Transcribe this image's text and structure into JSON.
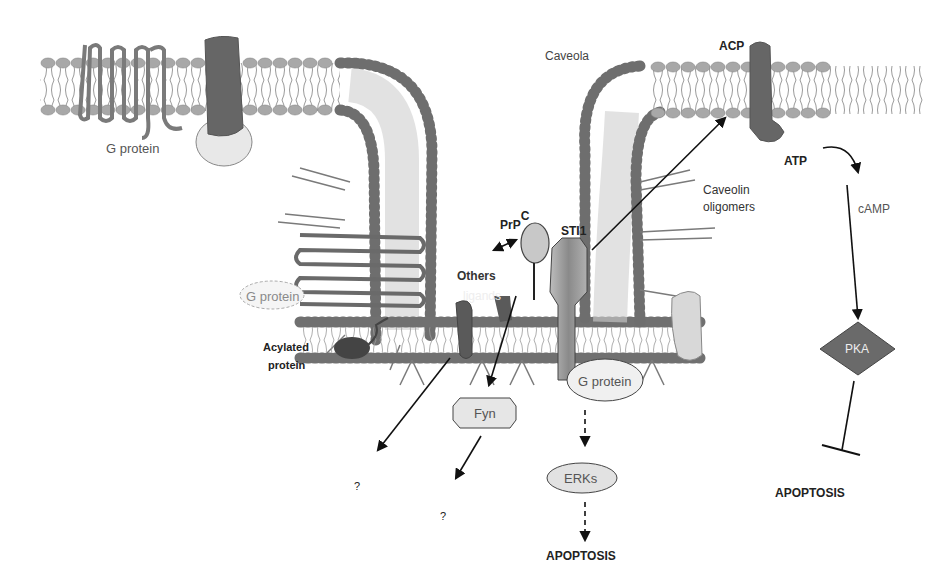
{
  "diagram": {
    "labels": {
      "caveola": "Caveola",
      "acp": "ACP",
      "atp": "ATP",
      "camp": "cAMP",
      "caveolin_line1": "Caveolin",
      "caveolin_line2": "oligomers",
      "prpc_main": "PrP",
      "prpc_sup": "C",
      "sti1": "STI1",
      "others": "Others",
      "ligands": "ligands",
      "g_protein_top": "G protein",
      "g_protein_left": "G protein",
      "g_protein_center": "G protein",
      "acylated_line1": "Acylated",
      "acylated_line2": "protein",
      "fyn": "Fyn",
      "erks": "ERKs",
      "pka": "PKA",
      "apoptosis_center": "APOPTOSIS",
      "apoptosis_right": "APOPTOSIS",
      "unknown_1": "?",
      "unknown_2": "?"
    },
    "colors": {
      "membrane_light": "#a8a8a8",
      "membrane_dark": "#6e6e6e",
      "protein_dark": "#5e5e5e",
      "protein_light": "#d9d9d9",
      "arrow": "#111111"
    }
  }
}
